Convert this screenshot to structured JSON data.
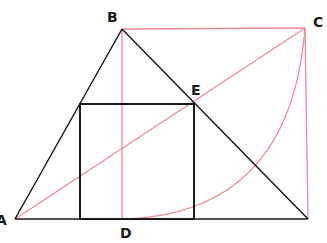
{
  "diagram": {
    "colors": {
      "black_line": "#1a1a1a",
      "red_line": "#ee8a92"
    },
    "labels": {
      "A": "A",
      "B": "B",
      "C": "C",
      "D": "D",
      "E": "E"
    },
    "points": {
      "A": [
        15,
        219
      ],
      "B": [
        122,
        29
      ],
      "C": [
        305,
        28
      ],
      "D": [
        122,
        219
      ],
      "E": [
        193,
        104
      ],
      "base_right": [
        308,
        219
      ]
    },
    "shapes": {
      "triangle": "A-B-base_right",
      "inscribed_square": {
        "x": 80,
        "y": 104,
        "w": 114,
        "h": 115
      },
      "red_rectangle": "B-C-vertical-to-base",
      "red_diagonal": "A-C",
      "red_vertical": "B-D",
      "red_arc": "D-to-C"
    }
  }
}
